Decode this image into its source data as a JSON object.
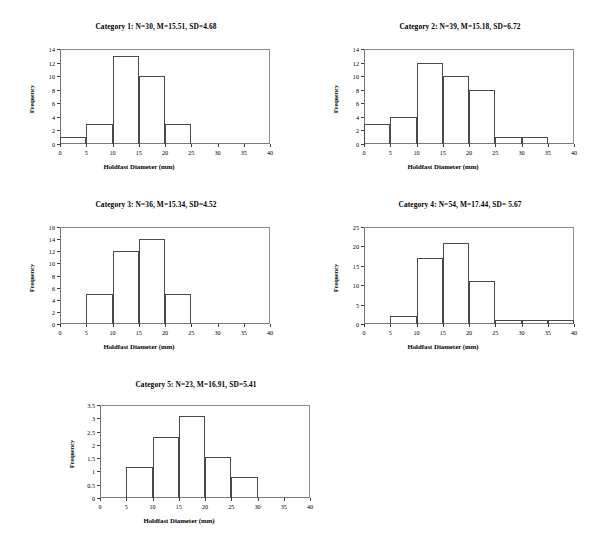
{
  "page": {
    "background": "#ffffff",
    "line_color": "#4a4a4a",
    "axis_color": "#3c3c3c"
  },
  "charts": [
    {
      "id": "category-1",
      "title": "Category 1: N=30, M=15.51, SD=4.68",
      "n": 30,
      "mean": 15.51,
      "sd": 4.68,
      "xlabel": "Holdfast Diameter (mm)",
      "ylabel": "Frequency",
      "xticks": [
        0,
        5,
        10,
        15,
        20,
        25,
        30,
        35,
        40
      ],
      "yticks": [
        0,
        2,
        4,
        6,
        8,
        10,
        12,
        14
      ],
      "xlim": [
        0,
        40
      ],
      "ylim": [
        0,
        14
      ],
      "bin_width": 5,
      "bins": [
        {
          "start": 0,
          "end": 5,
          "value": 1
        },
        {
          "start": 5,
          "end": 10,
          "value": 3
        },
        {
          "start": 10,
          "end": 15,
          "value": 13
        },
        {
          "start": 15,
          "end": 20,
          "value": 10
        },
        {
          "start": 20,
          "end": 25,
          "value": 3
        }
      ]
    },
    {
      "id": "category-2",
      "title": "Category 2: N=39, M=15.18, SD=6.72",
      "n": 39,
      "mean": 15.18,
      "sd": 6.72,
      "xlabel": "Holdfast Diameter (mm)",
      "ylabel": "Frequency",
      "xticks": [
        0,
        5,
        10,
        15,
        20,
        25,
        30,
        35,
        40
      ],
      "yticks": [
        0,
        2,
        4,
        6,
        8,
        10,
        12,
        14
      ],
      "xlim": [
        0,
        40
      ],
      "ylim": [
        0,
        14
      ],
      "bin_width": 5,
      "bins": [
        {
          "start": 0,
          "end": 5,
          "value": 3
        },
        {
          "start": 5,
          "end": 10,
          "value": 4
        },
        {
          "start": 10,
          "end": 15,
          "value": 12
        },
        {
          "start": 15,
          "end": 20,
          "value": 10
        },
        {
          "start": 20,
          "end": 25,
          "value": 8
        },
        {
          "start": 25,
          "end": 30,
          "value": 1
        },
        {
          "start": 30,
          "end": 35,
          "value": 1
        }
      ]
    },
    {
      "id": "category-3",
      "title": "Category 3: N=36, M=15.34, SD=4.52",
      "n": 36,
      "mean": 15.34,
      "sd": 4.52,
      "xlabel": "Holdfast Diameter (mm)",
      "ylabel": "Frequency",
      "xticks": [
        0,
        5,
        10,
        15,
        20,
        25,
        30,
        35,
        40
      ],
      "yticks": [
        0,
        2,
        4,
        6,
        8,
        10,
        12,
        14,
        16
      ],
      "xlim": [
        0,
        40
      ],
      "ylim": [
        0,
        16
      ],
      "bin_width": 5,
      "bins": [
        {
          "start": 5,
          "end": 10,
          "value": 5
        },
        {
          "start": 10,
          "end": 15,
          "value": 12
        },
        {
          "start": 15,
          "end": 20,
          "value": 14
        },
        {
          "start": 20,
          "end": 25,
          "value": 5
        }
      ]
    },
    {
      "id": "category-4",
      "title": "Category 4: N=54, M=17.44, SD= 5.67",
      "n": 54,
      "mean": 17.44,
      "sd": 5.67,
      "xlabel": "Holdfast Diameter (mm)",
      "ylabel": "Frequency",
      "xticks": [
        0,
        5,
        10,
        15,
        20,
        25,
        30,
        35,
        40
      ],
      "yticks": [
        0,
        5,
        10,
        15,
        20,
        25
      ],
      "xlim": [
        0,
        40
      ],
      "ylim": [
        0,
        25
      ],
      "bin_width": 5,
      "bins": [
        {
          "start": 5,
          "end": 10,
          "value": 2
        },
        {
          "start": 10,
          "end": 15,
          "value": 17
        },
        {
          "start": 15,
          "end": 20,
          "value": 21
        },
        {
          "start": 20,
          "end": 25,
          "value": 11
        },
        {
          "start": 25,
          "end": 30,
          "value": 1
        },
        {
          "start": 30,
          "end": 35,
          "value": 1
        },
        {
          "start": 35,
          "end": 40,
          "value": 1
        }
      ]
    },
    {
      "id": "category-5",
      "title": "Category 5: N=23, M=16.91, SD=5.41",
      "n": 23,
      "mean": 16.91,
      "sd": 5.41,
      "xlabel": "Holdfast Diameter (mm)",
      "ylabel": "Frequency",
      "xticks": [
        0,
        5,
        10,
        15,
        20,
        25,
        30,
        35,
        40
      ],
      "yticks": [
        0,
        0.5,
        1,
        1.5,
        2,
        2.5,
        3,
        3.5
      ],
      "xlim": [
        0,
        40
      ],
      "ylim": [
        0,
        3.5
      ],
      "bin_width": 5,
      "bins": [
        {
          "start": 5,
          "end": 10,
          "value": 1.17
        },
        {
          "start": 10,
          "end": 15,
          "value": 2.3
        },
        {
          "start": 15,
          "end": 20,
          "value": 3.1
        },
        {
          "start": 20,
          "end": 25,
          "value": 1.55
        },
        {
          "start": 25,
          "end": 30,
          "value": 0.78
        }
      ]
    }
  ],
  "chart_data": [
    {
      "type": "bar",
      "title": "Category 1: N=30, M=15.51, SD=4.68",
      "xlabel": "Holdfast Diameter (mm)",
      "ylabel": "Frequency",
      "categories": [
        "0-5",
        "5-10",
        "10-15",
        "15-20",
        "20-25",
        "25-30",
        "30-35",
        "35-40"
      ],
      "values": [
        1,
        3,
        13,
        10,
        3,
        0,
        0,
        0
      ],
      "xlim": [
        0,
        40
      ],
      "ylim": [
        0,
        14
      ],
      "grid": false,
      "legend": "none"
    },
    {
      "type": "bar",
      "title": "Category 2: N=39, M=15.18, SD=6.72",
      "xlabel": "Holdfast Diameter (mm)",
      "ylabel": "Frequency",
      "categories": [
        "0-5",
        "5-10",
        "10-15",
        "15-20",
        "20-25",
        "25-30",
        "30-35",
        "35-40"
      ],
      "values": [
        3,
        4,
        12,
        10,
        8,
        1,
        1,
        0
      ],
      "xlim": [
        0,
        40
      ],
      "ylim": [
        0,
        14
      ],
      "grid": false,
      "legend": "none"
    },
    {
      "type": "bar",
      "title": "Category 3: N=36, M=15.34, SD=4.52",
      "xlabel": "Holdfast Diameter (mm)",
      "ylabel": "Frequency",
      "categories": [
        "0-5",
        "5-10",
        "10-15",
        "15-20",
        "20-25",
        "25-30",
        "30-35",
        "35-40"
      ],
      "values": [
        0,
        5,
        12,
        14,
        5,
        0,
        0,
        0
      ],
      "xlim": [
        0,
        40
      ],
      "ylim": [
        0,
        16
      ],
      "grid": false,
      "legend": "none"
    },
    {
      "type": "bar",
      "title": "Category 4: N=54, M=17.44, SD= 5.67",
      "xlabel": "Holdfast Diameter (mm)",
      "ylabel": "Frequency",
      "categories": [
        "0-5",
        "5-10",
        "10-15",
        "15-20",
        "20-25",
        "25-30",
        "30-35",
        "35-40"
      ],
      "values": [
        0,
        2,
        17,
        21,
        11,
        1,
        1,
        1
      ],
      "xlim": [
        0,
        40
      ],
      "ylim": [
        0,
        25
      ],
      "grid": false,
      "legend": "none"
    },
    {
      "type": "bar",
      "title": "Category 5: N=23, M=16.91, SD=5.41",
      "xlabel": "Holdfast Diameter (mm)",
      "ylabel": "Frequency",
      "categories": [
        "0-5",
        "5-10",
        "10-15",
        "15-20",
        "20-25",
        "25-30",
        "30-35",
        "35-40"
      ],
      "values": [
        0,
        1.17,
        2.3,
        3.1,
        1.55,
        0.78,
        0,
        0
      ],
      "xlim": [
        0,
        3.5
      ],
      "ylim": [
        0,
        3.5
      ],
      "grid": false,
      "legend": "none"
    }
  ],
  "layout": {
    "panels": [
      {
        "left": 8,
        "top": 22,
        "width": 296,
        "height": 168,
        "plot_left": 52,
        "plot_top": 27,
        "plot_width": 210,
        "plot_height": 95
      },
      {
        "left": 312,
        "top": 22,
        "width": 296,
        "height": 168,
        "plot_left": 52,
        "plot_top": 27,
        "plot_width": 210,
        "plot_height": 95
      },
      {
        "left": 8,
        "top": 200,
        "width": 296,
        "height": 172,
        "plot_left": 52,
        "plot_top": 27,
        "plot_width": 210,
        "plot_height": 97
      },
      {
        "left": 312,
        "top": 200,
        "width": 296,
        "height": 172,
        "plot_left": 52,
        "plot_top": 27,
        "plot_width": 210,
        "plot_height": 97
      },
      {
        "left": 48,
        "top": 380,
        "width": 296,
        "height": 162,
        "plot_left": 52,
        "plot_top": 25,
        "plot_width": 210,
        "plot_height": 93
      }
    ]
  }
}
